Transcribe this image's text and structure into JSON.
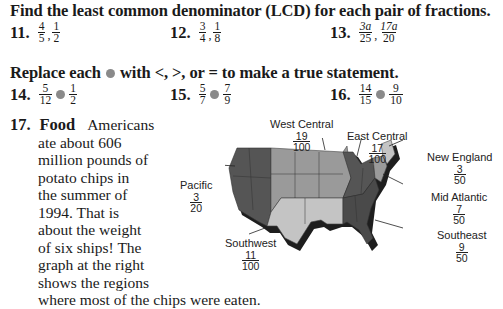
{
  "section1": {
    "heading": "Find the least common denominator (LCD) for each pair of fractions.",
    "items": [
      {
        "number": "11.",
        "a_num": "4",
        "a_den": "5",
        "b_num": "1",
        "b_den": "2"
      },
      {
        "number": "12.",
        "a_num": "3",
        "a_den": "4",
        "b_num": "1",
        "b_den": "8"
      },
      {
        "number": "13.",
        "a_num": "3a",
        "a_den": "25",
        "b_num": "17a",
        "b_den": "20"
      }
    ]
  },
  "section2": {
    "heading_pre": "Replace each",
    "heading_post": "with <, >, or = to make a true statement.",
    "items": [
      {
        "number": "14.",
        "a_num": "5",
        "a_den": "12",
        "b_num": "1",
        "b_den": "2"
      },
      {
        "number": "15.",
        "a_num": "5",
        "a_den": "7",
        "b_num": "7",
        "b_den": "9"
      },
      {
        "number": "16.",
        "a_num": "14",
        "a_den": "15",
        "b_num": "9",
        "b_den": "10"
      }
    ]
  },
  "problem17": {
    "number": "17.",
    "topic": "Food",
    "lines": [
      "Americans",
      "ate about 606",
      "million pounds of",
      "potato chips in",
      "the summer of",
      "1994. That is",
      "about the weight",
      "of six ships! The",
      "graph at the right",
      "shows the regions",
      "where most of the chips were eaten."
    ]
  },
  "map": {
    "colors": {
      "dark": "#555555",
      "medium": "#9a9a9a",
      "light": "#c4c4c4",
      "shadow": "#1e1e1e"
    },
    "regions": [
      {
        "name": "West Central",
        "num": "19",
        "den": "100"
      },
      {
        "name": "East Central",
        "num": "17",
        "den": "100"
      },
      {
        "name": "New England",
        "num": "3",
        "den": "50"
      },
      {
        "name": "Mid Atlantic",
        "num": "7",
        "den": "50"
      },
      {
        "name": "Southeast",
        "num": "9",
        "den": "50"
      },
      {
        "name": "Southwest",
        "num": "11",
        "den": "100"
      },
      {
        "name": "Pacific",
        "num": "3",
        "den": "20"
      }
    ]
  }
}
